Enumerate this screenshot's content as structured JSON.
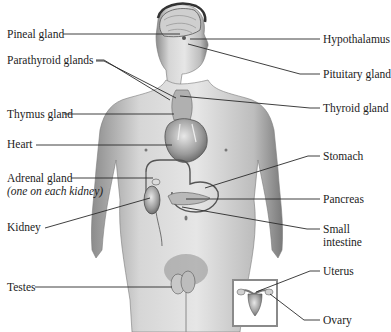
{
  "diagram": {
    "labels_left": [
      {
        "id": "pineal",
        "text": "Pineal gland",
        "x": 7,
        "y": 28
      },
      {
        "id": "parathyroid",
        "text": "Parathyroid glands",
        "x": 7,
        "y": 54
      },
      {
        "id": "thymus",
        "text": "Thymus gland",
        "x": 7,
        "y": 108
      },
      {
        "id": "heart",
        "text": "Heart",
        "x": 7,
        "y": 138
      },
      {
        "id": "adrenal",
        "text": "Adrenal gland",
        "x": 7,
        "y": 172
      },
      {
        "id": "adrenal_note",
        "text": "(one on each kidney)",
        "x": 7,
        "y": 185,
        "italic": true
      },
      {
        "id": "kidney",
        "text": "Kidney",
        "x": 7,
        "y": 221
      },
      {
        "id": "testes",
        "text": "Testes",
        "x": 7,
        "y": 281
      }
    ],
    "labels_right": [
      {
        "id": "hypothalamus",
        "text": "Hypothalamus",
        "x": 323,
        "y": 33
      },
      {
        "id": "pituitary",
        "text": "Pituitary gland",
        "x": 323,
        "y": 69
      },
      {
        "id": "thyroid",
        "text": "Thyroid gland",
        "x": 323,
        "y": 103
      },
      {
        "id": "stomach",
        "text": "Stomach",
        "x": 323,
        "y": 150
      },
      {
        "id": "pancreas",
        "text": "Pancreas",
        "x": 323,
        "y": 193
      },
      {
        "id": "small_intestine_1",
        "text": "Small",
        "x": 323,
        "y": 224
      },
      {
        "id": "small_intestine_2",
        "text": "intestine",
        "x": 323,
        "y": 237
      },
      {
        "id": "uterus",
        "text": "Uterus",
        "x": 323,
        "y": 266
      },
      {
        "id": "ovary",
        "text": "Ovary",
        "x": 323,
        "y": 314
      }
    ],
    "leader_lines": [
      {
        "for": "pineal",
        "points": "63,34 180,34"
      },
      {
        "for": "parathyroid",
        "points": "96,60 104,60 170,100"
      },
      {
        "for": "parathyroid_2",
        "points": "96,61 104,61 175,98"
      },
      {
        "for": "thymus",
        "points": "64,114 172,114"
      },
      {
        "for": "heart",
        "points": "36,145 175,145"
      },
      {
        "for": "adrenal",
        "points": "71,178 155,178"
      },
      {
        "for": "kidney",
        "points": "45,228 148,198"
      },
      {
        "for": "testes",
        "points": "35,287 170,287"
      },
      {
        "for": "hypothalamus",
        "points": "190,39 320,39"
      },
      {
        "for": "pituitary",
        "points": "188,44 300,74 320,74"
      },
      {
        "for": "thyroid",
        "points": "180,96 310,108 320,108"
      },
      {
        "for": "stomach",
        "points": "205,180 308,156 320,156"
      },
      {
        "for": "pancreas",
        "points": "185,199 320,199"
      },
      {
        "for": "small_intestine",
        "points": "182,207 307,229 320,229"
      },
      {
        "for": "uterus",
        "points": "258,290 310,271 320,271"
      },
      {
        "for": "ovary",
        "points": "276,296 304,320 320,320"
      }
    ],
    "inset": {
      "label": "female-reproductive-inset",
      "x": 233,
      "y": 280,
      "w": 44,
      "h": 46,
      "border": "#8a8a8a"
    },
    "colors": {
      "line": "#2a2a2a",
      "skin_light": "#d9d9d9",
      "skin_mid": "#a8a8a8",
      "skin_dark": "#6e6e6e",
      "background": "#ffffff"
    }
  }
}
